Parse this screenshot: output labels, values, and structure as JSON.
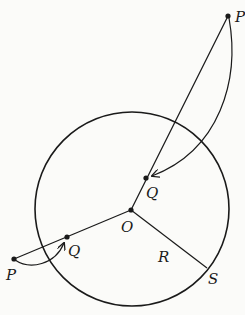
{
  "diagram": {
    "type": "circle-inversion",
    "circle": {
      "center": "O",
      "radius_label": "R"
    },
    "labels": {
      "P_outer_top": "P",
      "Q_inner_top": "Q",
      "O": "O",
      "Q_left": "Q",
      "P_left": "P",
      "R": "R",
      "S": "S"
    },
    "colors": {
      "ink": "#1a1a1a",
      "background": "#fbfbf9"
    }
  }
}
